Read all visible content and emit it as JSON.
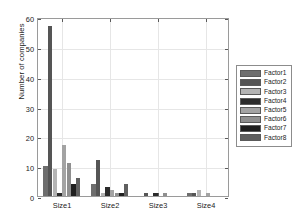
{
  "chart_data": {
    "type": "bar",
    "title": "",
    "subtitle": "",
    "xlabel": "",
    "ylabel": "Number of companies",
    "categories": [
      "Size1",
      "Size2",
      "Size3",
      "Size4"
    ],
    "ylim": [
      0,
      60
    ],
    "yticks": [
      0,
      10,
      20,
      30,
      40,
      50,
      60
    ],
    "ytick_labels": [
      "0",
      "10",
      "20",
      "30",
      "40",
      "50",
      "60"
    ],
    "grid": true,
    "grid_axis": "both",
    "legend_position": "outside-right",
    "grouping": "grouped",
    "series": [
      {
        "name": "Factor1",
        "color": "#6e6e6e",
        "values": [
          10,
          4,
          0,
          1
        ]
      },
      {
        "name": "Factor2",
        "color": "#555555",
        "values": [
          57,
          12,
          1,
          1
        ]
      },
      {
        "name": "Factor3",
        "color": "#b4b4b4",
        "values": [
          9,
          1,
          0,
          2
        ]
      },
      {
        "name": "Factor4",
        "color": "#2b2b2b",
        "values": [
          1,
          3,
          1,
          0
        ]
      },
      {
        "name": "Factor5",
        "color": "#a3a3a3",
        "values": [
          17,
          2,
          0,
          1
        ]
      },
      {
        "name": "Factor6",
        "color": "#8f8f8f",
        "values": [
          11,
          1,
          1,
          0
        ]
      },
      {
        "name": "Factor7",
        "color": "#1f1f1f",
        "values": [
          4,
          1,
          0,
          0
        ]
      },
      {
        "name": "Factor8",
        "color": "#5f5f5f",
        "values": [
          6,
          4,
          0,
          0
        ]
      }
    ]
  },
  "legend": {
    "items": [
      {
        "label": "Factor1"
      },
      {
        "label": "Factor2"
      },
      {
        "label": "Factor3"
      },
      {
        "label": "Factor4"
      },
      {
        "label": "Factor5"
      },
      {
        "label": "Factor6"
      },
      {
        "label": "Factor7"
      },
      {
        "label": "Factor8"
      }
    ]
  },
  "colors": {
    "axis": "#9a9a9a",
    "grid": "#e6e6e6",
    "text": "#1a1a1a",
    "background": "#ffffff"
  }
}
